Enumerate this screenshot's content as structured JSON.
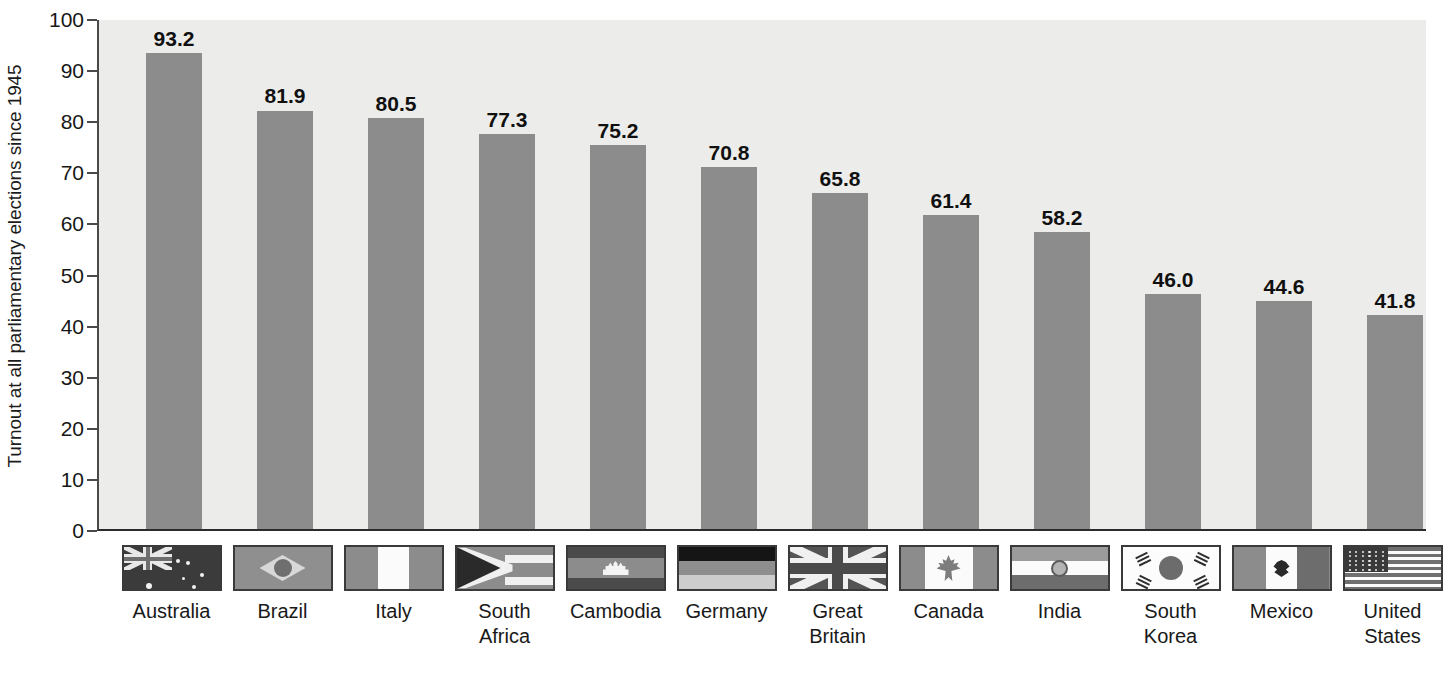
{
  "chart_data": {
    "type": "bar",
    "title": "",
    "xlabel": "",
    "ylabel": "Turnout at all parliamentary elections since 1945",
    "ylim": [
      0,
      100
    ],
    "ytick_labels": [
      "0",
      "10",
      "20",
      "30",
      "40",
      "50",
      "60",
      "70",
      "80",
      "90",
      "100"
    ],
    "yticks": [
      0,
      10,
      20,
      30,
      40,
      50,
      60,
      70,
      80,
      90,
      100
    ],
    "grid": false,
    "legend": "none",
    "categories": [
      "Australia",
      "Brazil",
      "Italy",
      "South Africa",
      "Cambodia",
      "Germany",
      "Great Britain",
      "Canada",
      "India",
      "South Korea",
      "Mexico",
      "United States"
    ],
    "values": [
      93.2,
      81.9,
      80.5,
      77.3,
      75.2,
      70.8,
      65.8,
      61.4,
      58.2,
      46.0,
      44.6,
      41.8
    ],
    "value_labels": [
      "93.2",
      "81.9",
      "80.5",
      "77.3",
      "75.2",
      "70.8",
      "65.8",
      "61.4",
      "58.2",
      "46.0",
      "44.6",
      "41.8"
    ],
    "category_label_lines": [
      [
        "Australia"
      ],
      [
        "Brazil"
      ],
      [
        "Italy"
      ],
      [
        "South",
        "Africa"
      ],
      [
        "Cambodia"
      ],
      [
        "Germany"
      ],
      [
        "Great",
        "Britain"
      ],
      [
        "Canada"
      ],
      [
        "India"
      ],
      [
        "South",
        "Korea"
      ],
      [
        "Mexico"
      ],
      [
        "United",
        "States"
      ]
    ],
    "flags": [
      "australia-flag",
      "brazil-flag",
      "italy-flag",
      "south-africa-flag",
      "cambodia-flag",
      "germany-flag",
      "great-britain-flag",
      "canada-flag",
      "india-flag",
      "south-korea-flag",
      "mexico-flag",
      "united-states-flag"
    ]
  },
  "colors": {
    "bar_fill": "#8c8c8c",
    "plot_background": "#ececeb",
    "axis_line": "#2b2b2b",
    "text": "#171717",
    "page_background": "#ffffff"
  },
  "caption": ""
}
